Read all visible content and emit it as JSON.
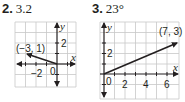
{
  "problems": [
    {
      "number": "2.",
      "answer": "3.2",
      "graph": {
        "x_label": "x",
        "y_label": "y",
        "x_tick_label": "−2",
        "y_tick_label": "2",
        "origin_label": "0",
        "point_label": "(−3, 1)",
        "vector": {
          "from": [
            0,
            0
          ],
          "to": [
            -3,
            1
          ]
        }
      }
    },
    {
      "number": "3.",
      "answer": "23°",
      "graph": {
        "x_label": "x",
        "y_label": "y",
        "x_tick_labels": [
          "2",
          "4",
          "6"
        ],
        "y_tick_label": "2",
        "origin_label": "0",
        "point_label": "(7, 3)",
        "vector": {
          "from": [
            0,
            0
          ],
          "to": [
            7,
            3
          ]
        }
      }
    }
  ],
  "colors": {
    "grid": "#c8c8c8",
    "axis": "#231f20",
    "text": "#231f20"
  }
}
